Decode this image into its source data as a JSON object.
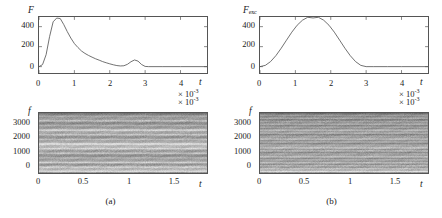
{
  "figure": {
    "background": "#ffffff",
    "line_color": "#555555",
    "axis_color": "#555555"
  },
  "panels": [
    {
      "id": "a",
      "caption": "(a)",
      "lineplot": {
        "ylabel": "F",
        "ylabel_sub": "",
        "xlabel": "t",
        "exponent": "× 10",
        "exponent_sup": "-3",
        "yticks": [
          "0",
          "200",
          "400"
        ],
        "ytick_values": [
          0,
          200,
          400
        ],
        "xticks": [
          "0",
          "1",
          "2",
          "3",
          "4"
        ],
        "xtick_values": [
          0,
          1,
          2,
          3,
          4
        ]
      },
      "spectrogram": {
        "ylabel": "f",
        "xlabel": "t",
        "exponent": "× 10",
        "exponent_sup": "-3",
        "yticks": [
          "0",
          "1000",
          "2000",
          "3000"
        ],
        "ytick_values": [
          0,
          1000,
          2000,
          3000
        ],
        "xticks": [
          "0",
          "0.5",
          "1",
          "1.5"
        ],
        "xtick_values": [
          0,
          0.5,
          1,
          1.5
        ]
      }
    },
    {
      "id": "b",
      "caption": "(b)",
      "lineplot": {
        "ylabel": "F",
        "ylabel_sub": "exc",
        "xlabel": "t",
        "exponent": "× 10",
        "exponent_sup": "-3",
        "yticks": [
          "0",
          "200",
          "400"
        ],
        "ytick_values": [
          0,
          200,
          400
        ],
        "xticks": [
          "0",
          "1",
          "2",
          "3",
          "4"
        ],
        "xtick_values": [
          0,
          1,
          2,
          3,
          4
        ]
      },
      "spectrogram": {
        "ylabel": "f",
        "xlabel": "t",
        "exponent": "× 10",
        "exponent_sup": "-3",
        "yticks": [
          "0",
          "1000",
          "2000",
          "3000"
        ],
        "ytick_values": [
          0,
          1000,
          2000,
          3000
        ],
        "xticks": [
          "0",
          "0.5",
          "1",
          "1.5"
        ],
        "xtick_values": [
          0,
          0.5,
          1,
          1.5
        ]
      }
    }
  ],
  "chart_data": [
    {
      "type": "line",
      "panel": "a",
      "title": "",
      "xlabel": "t",
      "ylabel": "F",
      "x_scale_exponent": -3,
      "xlim": [
        0,
        4.75
      ],
      "ylim": [
        0,
        560
      ],
      "grid": false,
      "legend": "none",
      "description": "Contact force versus time: sharp primary impact peak followed by a smaller rebound peak.",
      "x": [
        0.0,
        0.1,
        0.2,
        0.3,
        0.4,
        0.5,
        0.6,
        0.7,
        0.8,
        0.9,
        1.0,
        1.1,
        1.2,
        1.3,
        1.4,
        1.5,
        1.6,
        1.7,
        1.8,
        1.9,
        2.0,
        2.1,
        2.2,
        2.3,
        2.4,
        2.5,
        2.6,
        2.7,
        2.8,
        2.9,
        3.0,
        3.1,
        3.5,
        4.0,
        4.75
      ],
      "y": [
        0,
        20,
        120,
        300,
        450,
        505,
        500,
        440,
        370,
        305,
        250,
        210,
        175,
        150,
        130,
        112,
        96,
        82,
        68,
        56,
        45,
        36,
        28,
        24,
        26,
        40,
        66,
        84,
        72,
        38,
        4,
        0,
        0,
        0,
        0
      ]
    },
    {
      "type": "line",
      "panel": "b",
      "title": "",
      "xlabel": "t",
      "ylabel": "F_exc",
      "x_scale_exponent": -3,
      "xlim": [
        0,
        4.75
      ],
      "ylim": [
        0,
        560
      ],
      "grid": false,
      "legend": "none",
      "description": "Excitation force versus time: smooth symmetric bell (Hann-like) pulse peaking near t = 1.5e-3.",
      "x": [
        0.0,
        0.15,
        0.3,
        0.45,
        0.6,
        0.75,
        0.9,
        1.05,
        1.2,
        1.35,
        1.5,
        1.65,
        1.8,
        1.95,
        2.1,
        2.25,
        2.4,
        2.55,
        2.7,
        2.85,
        3.0,
        3.2,
        3.6,
        4.0,
        4.75
      ],
      "y": [
        0,
        13,
        50,
        110,
        185,
        265,
        345,
        415,
        465,
        495,
        505,
        495,
        465,
        415,
        345,
        265,
        185,
        110,
        50,
        13,
        0,
        0,
        0,
        0,
        0
      ]
    },
    {
      "type": "heatmap",
      "panel": "a",
      "title": "",
      "xlabel": "t",
      "ylabel": "f",
      "x_scale_exponent": -3,
      "xlim": [
        0,
        1.85
      ],
      "ylim": [
        0,
        3600
      ],
      "colormap": "grayscale",
      "description": "Time-frequency spectrogram showing broad horizontal harmonic bands, roughly constant in time, with wide bright bands near 1700 and 2600 Hz.",
      "band_frequencies": [
        80,
        210,
        340,
        470,
        620,
        760,
        900,
        1040,
        1180,
        1320,
        1460,
        1600,
        1740,
        1880,
        2020,
        2160,
        2300,
        2440,
        2580,
        2720,
        2860,
        3000,
        3140,
        3280,
        3420,
        3560
      ],
      "band_intensities": [
        0.86,
        0.52,
        0.74,
        0.4,
        0.78,
        0.46,
        0.62,
        0.36,
        0.7,
        0.44,
        0.8,
        0.58,
        0.88,
        0.5,
        0.66,
        0.38,
        0.72,
        0.48,
        0.82,
        0.42,
        0.6,
        0.34,
        0.68,
        0.44,
        0.56,
        0.3
      ]
    },
    {
      "type": "heatmap",
      "panel": "b",
      "title": "",
      "xlabel": "t",
      "ylabel": "f",
      "x_scale_exponent": -3,
      "xlim": [
        0,
        1.85
      ],
      "ylim": [
        0,
        3600
      ],
      "colormap": "grayscale",
      "description": "Time-frequency spectrogram with denser, finer horizontal striations than panel (a); brightest band near the low-frequency base.",
      "band_frequencies": [
        60,
        150,
        240,
        330,
        420,
        510,
        600,
        690,
        780,
        870,
        960,
        1050,
        1140,
        1230,
        1320,
        1410,
        1500,
        1590,
        1680,
        1770,
        1860,
        1950,
        2040,
        2130,
        2220,
        2310,
        2400,
        2490,
        2580,
        2670,
        2760,
        2850,
        2940,
        3030,
        3120,
        3210,
        3300,
        3390,
        3480,
        3570
      ],
      "band_intensities": [
        0.94,
        0.55,
        0.72,
        0.44,
        0.66,
        0.38,
        0.7,
        0.42,
        0.62,
        0.36,
        0.74,
        0.46,
        0.58,
        0.34,
        0.68,
        0.4,
        0.76,
        0.5,
        0.6,
        0.32,
        0.64,
        0.38,
        0.72,
        0.44,
        0.56,
        0.3,
        0.66,
        0.42,
        0.7,
        0.36,
        0.58,
        0.32,
        0.62,
        0.4,
        0.54,
        0.28,
        0.6,
        0.34,
        0.5,
        0.26
      ]
    }
  ]
}
